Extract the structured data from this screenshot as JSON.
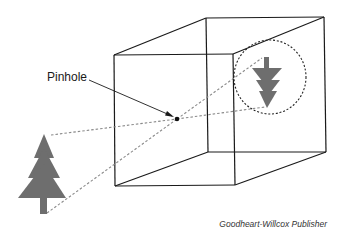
{
  "diagram": {
    "labels": {
      "pinhole": "Pinhole"
    },
    "credit": "Goodheart-Willcox Publisher",
    "colors": {
      "outline": "#1a1a1a",
      "tree": "#6e6e6e",
      "rays": "#8a8a8a",
      "circle": "#222222",
      "background": "#ffffff"
    }
  }
}
